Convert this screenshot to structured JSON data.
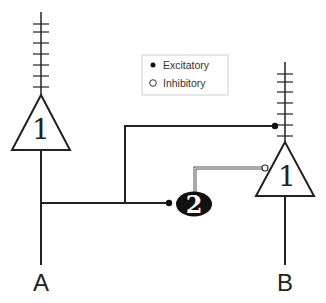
{
  "legend": {
    "items": [
      {
        "symbol": "filled-dot",
        "label": "Excitatory"
      },
      {
        "symbol": "hollow-circle",
        "label": "Inhibitory"
      }
    ]
  },
  "neurons": {
    "left": {
      "label": "1",
      "axon_label": "A"
    },
    "right": {
      "label": "1",
      "axon_label": "B"
    },
    "interneuron": {
      "label": "2"
    }
  },
  "colors": {
    "line": "#222222",
    "legend_border": "#d0d0d0",
    "inhibitory_line": "#666666",
    "interneuron_fill": "#111111"
  }
}
